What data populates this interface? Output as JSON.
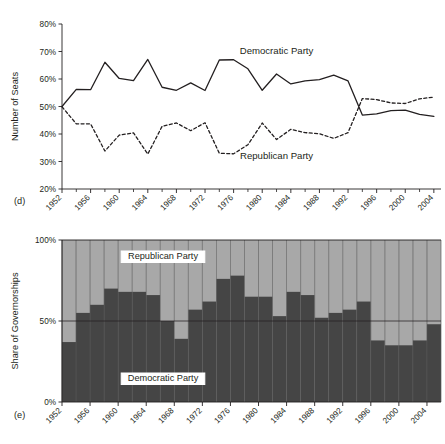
{
  "figure_d": {
    "panel_letter": "(d)",
    "ylabel": "Number of Seats",
    "series_labels": {
      "democratic": "Democratic Party",
      "republican": "Republican Party"
    },
    "y_ticks": [
      "20%",
      "30%",
      "40%",
      "50%",
      "60%",
      "70%",
      "80%"
    ],
    "x_ticks": [
      "1952",
      "1956",
      "1960",
      "1964",
      "1968",
      "1972",
      "1976",
      "1980",
      "1984",
      "1988",
      "1992",
      "1996",
      "2000",
      "2004"
    ]
  },
  "figure_e": {
    "panel_letter": "(e)",
    "ylabel": "Share of Governorships",
    "series_labels": {
      "democratic": "Democratic Party",
      "republican": "Republican Party"
    },
    "y_ticks": [
      "0%",
      "50%",
      "100%"
    ],
    "x_ticks": [
      "1952",
      "1956",
      "1960",
      "1964",
      "1968",
      "1972",
      "1976",
      "1980",
      "1984",
      "1988",
      "1992",
      "1996",
      "2000",
      "2004"
    ]
  },
  "colors": {
    "democratic_fill": "#454545",
    "republican_fill": "#a8a8a8",
    "axis": "#231f20",
    "gridline": "#555555",
    "background": "#ffffff"
  },
  "chart_data": [
    {
      "type": "line",
      "title": "",
      "panel": "(d)",
      "xlabel": "",
      "ylabel": "Number of Seats",
      "xlim": [
        1952,
        2005
      ],
      "ylim": [
        20,
        80
      ],
      "ytick_values": [
        20,
        30,
        40,
        50,
        60,
        70,
        80
      ],
      "ytick_labels": [
        "20%",
        "30%",
        "40%",
        "50%",
        "60%",
        "70%",
        "80%"
      ],
      "xtick_values": [
        1952,
        1956,
        1960,
        1964,
        1968,
        1972,
        1976,
        1980,
        1984,
        1988,
        1992,
        1996,
        2000,
        2004
      ],
      "xtick_minor_values": [
        1954,
        1958,
        1962,
        1966,
        1970,
        1974,
        1978,
        1982,
        1986,
        1990,
        1994,
        1998,
        2002
      ],
      "grid": false,
      "legend": "inline-annotation",
      "x": [
        1952,
        1954,
        1956,
        1958,
        1960,
        1962,
        1964,
        1966,
        1968,
        1970,
        1972,
        1974,
        1976,
        1978,
        1980,
        1982,
        1984,
        1986,
        1988,
        1990,
        1992,
        1994,
        1996,
        1998,
        2000,
        2002,
        2004
      ],
      "series": [
        {
          "name": "Democratic Party",
          "style": "solid",
          "values": [
            50.0,
            56.2,
            56.1,
            66.1,
            60.2,
            59.4,
            67.1,
            57.0,
            55.9,
            58.6,
            55.8,
            66.9,
            67.0,
            63.7,
            55.9,
            61.8,
            58.2,
            59.3,
            59.8,
            61.4,
            59.3,
            46.9,
            47.3,
            48.5,
            48.7,
            47.1,
            46.4
          ]
        },
        {
          "name": "Republican Party",
          "style": "dashed",
          "values": [
            49.9,
            43.7,
            43.7,
            33.8,
            39.6,
            40.4,
            32.7,
            42.8,
            44.0,
            41.2,
            44.1,
            33.0,
            32.8,
            36.1,
            44.0,
            38.0,
            41.7,
            40.5,
            40.1,
            38.4,
            40.5,
            52.9,
            52.5,
            51.3,
            51.1,
            52.8,
            53.4
          ]
        }
      ],
      "annotations": [
        {
          "text": "Democratic Party",
          "x": 1982,
          "y": 69
        },
        {
          "text": "Republican Party",
          "x": 1982,
          "y": 31
        }
      ]
    },
    {
      "type": "bar",
      "subtype": "stacked-100",
      "panel": "(e)",
      "title": "",
      "xlabel": "",
      "ylabel": "Share of Governorships",
      "ylim": [
        0,
        100
      ],
      "ytick_values": [
        0,
        50,
        100
      ],
      "ytick_labels": [
        "0%",
        "50%",
        "100%"
      ],
      "xtick_values": [
        1952,
        1956,
        1960,
        1964,
        1968,
        1972,
        1976,
        1980,
        1984,
        1988,
        1992,
        1996,
        2000,
        2004
      ],
      "grid": true,
      "legend": "inline-boxed",
      "categories": [
        1952,
        1954,
        1956,
        1958,
        1960,
        1962,
        1964,
        1966,
        1968,
        1970,
        1972,
        1974,
        1976,
        1978,
        1980,
        1982,
        1984,
        1986,
        1988,
        1990,
        1992,
        1994,
        1996,
        1998,
        2000,
        2002,
        2004
      ],
      "series": [
        {
          "name": "Democratic Party",
          "values": [
            37.0,
            55.0,
            60.0,
            70.0,
            68.0,
            68.0,
            66.0,
            50.0,
            39.0,
            57.0,
            62.0,
            76.0,
            78.0,
            65.0,
            65.0,
            53.0,
            68.0,
            66.0,
            52.0,
            55.0,
            57.0,
            62.0,
            38.0,
            35.0,
            35.0,
            38.0,
            48.0,
            44.0
          ]
        },
        {
          "name": "Republican Party",
          "values": [
            63.0,
            45.0,
            40.0,
            30.0,
            32.0,
            32.0,
            34.0,
            50.0,
            61.0,
            43.0,
            38.0,
            24.0,
            22.0,
            35.0,
            35.0,
            47.0,
            32.0,
            34.0,
            48.0,
            45.0,
            43.0,
            38.0,
            62.0,
            65.0,
            65.0,
            62.0,
            52.0,
            56.0
          ]
        }
      ],
      "annotations": [
        {
          "text": "Republican Party",
          "position": "upper-left"
        },
        {
          "text": "Democratic Party",
          "position": "lower-left"
        }
      ]
    }
  ]
}
